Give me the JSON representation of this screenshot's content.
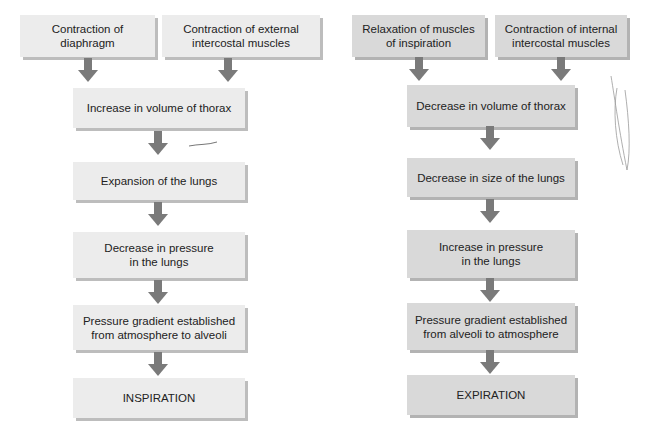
{
  "inspiration": {
    "inputs": [
      {
        "label": "Contraction of\ndiaphragm"
      },
      {
        "label": "Contraction of external\nintercostal muscles"
      }
    ],
    "steps": [
      {
        "label": "Increase in volume of thorax"
      },
      {
        "label": "Expansion of the lungs"
      },
      {
        "label": "Decrease in pressure\nin the lungs"
      },
      {
        "label": "Pressure gradient established\nfrom atmosphere to alveoli"
      },
      {
        "label": "INSPIRATION"
      }
    ]
  },
  "expiration": {
    "inputs": [
      {
        "label": "Relaxation of muscles\nof inspiration"
      },
      {
        "label": "Contraction of internal\nintercostal muscles"
      }
    ],
    "steps": [
      {
        "label": "Decrease in volume of thorax"
      },
      {
        "label": "Decrease in size of the lungs"
      },
      {
        "label": "Increase in pressure\nin the lungs"
      },
      {
        "label": "Pressure gradient established\nfrom alveoli to atmosphere"
      },
      {
        "label": "EXPIRATION"
      }
    ]
  },
  "colors": {
    "inspiration_box": "#ececec",
    "expiration_box": "#d9d9d9",
    "arrow": "#7a7a7a"
  }
}
